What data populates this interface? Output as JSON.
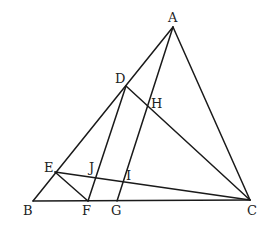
{
  "diagram": {
    "type": "geometry",
    "stroke_color": "#1a1a1a",
    "points": {
      "A": {
        "label": "A",
        "x": 173,
        "y": 27,
        "lx": 168,
        "ly": 22
      },
      "B": {
        "label": "B",
        "x": 33,
        "y": 201,
        "lx": 23,
        "ly": 215
      },
      "C": {
        "label": "C",
        "x": 250,
        "y": 200,
        "lx": 247,
        "ly": 215
      },
      "D": {
        "label": "D",
        "x": 126,
        "y": 86,
        "lx": 115,
        "ly": 83
      },
      "E": {
        "label": "E",
        "x": 55,
        "y": 172,
        "lx": 44,
        "ly": 172
      },
      "F": {
        "label": "F",
        "x": 88,
        "y": 201,
        "lx": 82,
        "ly": 215
      },
      "G": {
        "label": "G",
        "x": 117,
        "y": 201,
        "lx": 111,
        "ly": 215
      },
      "H": {
        "label": "H",
        "x": 148,
        "y": 104,
        "lx": 151,
        "ly": 108
      },
      "I": {
        "label": "I",
        "x": 124,
        "y": 181,
        "lx": 126,
        "ly": 180
      },
      "J": {
        "label": "J",
        "x": 95,
        "y": 177,
        "lx": 89,
        "ly": 172
      }
    },
    "segments": [
      {
        "id": "AB",
        "from": "A",
        "to": "B"
      },
      {
        "id": "AC",
        "from": "A",
        "to": "C"
      },
      {
        "id": "BC",
        "from": "B",
        "to": "C"
      },
      {
        "id": "AG",
        "from": "A",
        "to": "G"
      },
      {
        "id": "DC",
        "from": "D",
        "to": "C"
      },
      {
        "id": "DF",
        "from": "D",
        "to": "F"
      },
      {
        "id": "EC",
        "from": "E",
        "to": "C"
      },
      {
        "id": "EF",
        "from": "E",
        "to": "F"
      }
    ]
  }
}
